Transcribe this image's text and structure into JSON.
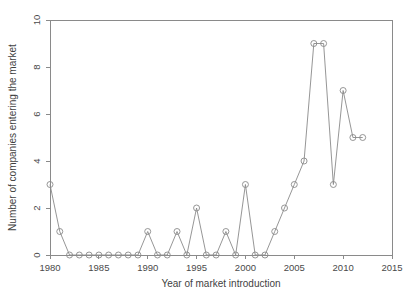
{
  "chart_data": {
    "type": "line",
    "title": "",
    "xlabel": "Year of market introduction",
    "ylabel": "Number of companies entering the market",
    "xlim": [
      1980,
      2015
    ],
    "ylim": [
      0,
      10
    ],
    "xticks": [
      1980,
      1985,
      1990,
      1995,
      2000,
      2005,
      2010,
      2015
    ],
    "yticks": [
      0,
      2,
      4,
      6,
      8,
      10
    ],
    "xticklabels": [
      "1980",
      "1985",
      "1990",
      "1995",
      "2000",
      "2005",
      "2010",
      "2015"
    ],
    "yticklabels": [
      "0",
      "2",
      "4",
      "6",
      "8",
      "10"
    ],
    "grid": false,
    "legend": false,
    "marker": "open-circle",
    "line_color": "#8a8a8a",
    "marker_color": "#8a8a8a",
    "x": [
      1980,
      1981,
      1982,
      1983,
      1984,
      1985,
      1986,
      1987,
      1988,
      1989,
      1990,
      1991,
      1992,
      1993,
      1994,
      1995,
      1996,
      1997,
      1998,
      1999,
      2000,
      2001,
      2002,
      2003,
      2004,
      2005,
      2006,
      2007,
      2008,
      2009,
      2010,
      2011,
      2012
    ],
    "values": [
      3,
      1,
      0,
      0,
      0,
      0,
      0,
      0,
      0,
      0,
      1,
      0,
      0,
      1,
      0,
      2,
      0,
      0,
      1,
      0,
      3,
      0,
      0,
      1,
      2,
      3,
      4,
      9,
      9,
      3,
      7,
      5,
      5
    ],
    "series": [
      {
        "name": "Companies entering the market",
        "values": [
          3,
          1,
          0,
          0,
          0,
          0,
          0,
          0,
          0,
          0,
          1,
          0,
          0,
          1,
          0,
          2,
          0,
          0,
          1,
          0,
          3,
          0,
          0,
          1,
          2,
          3,
          4,
          9,
          9,
          3,
          7,
          5,
          5
        ]
      }
    ]
  }
}
